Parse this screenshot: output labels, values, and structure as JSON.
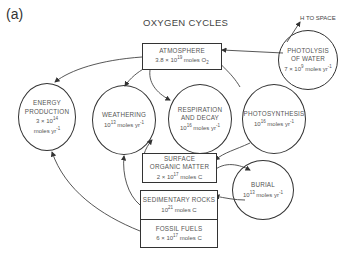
{
  "panel_label": "(a)",
  "title": "OXYGEN CYCLES",
  "note": "H TO SPACE",
  "nodes": {
    "atmosphere": {
      "name": "ATMOSPHERE",
      "value": "3.8 × 10^19 moles O2",
      "shape": "box"
    },
    "photolysis": {
      "name": "PHOTOLYSIS OF WATER",
      "value": "7 × 10^9 moles yr^-1",
      "shape": "circle"
    },
    "energy": {
      "name": "ENERGY PRODUCTION",
      "value": "3 × 10^14 moles yr^-1",
      "shape": "circle"
    },
    "weathering": {
      "name": "WEATHERING",
      "value": "10^13 moles yr^-1",
      "shape": "circle"
    },
    "respiration": {
      "name": "RESPIRATION AND DECAY",
      "value": "10^16 moles yr^-1",
      "shape": "circle"
    },
    "photosynthesis": {
      "name": "PHOTOSYNTHESIS",
      "value": "10^16 moles yr^-1",
      "shape": "circle"
    },
    "surface": {
      "name": "SURFACE ORGANIC MATTER",
      "value": "2 × 10^17 moles C",
      "shape": "box"
    },
    "burial": {
      "name": "BURIAL",
      "value": "10^13 moles yr^-1",
      "shape": "circle"
    },
    "sedimentary": {
      "name": "SEDIMENTARY ROCKS",
      "value": "10^21 moles C",
      "shape": "box"
    },
    "fossil": {
      "name": "FOSSIL FUELS",
      "value": "6 × 10^17 moles C",
      "shape": "box"
    }
  },
  "text": {
    "atm_name": "ATMOSPHERE",
    "atm_val_a": "3.8 × 10",
    "atm_exp": "19",
    "atm_val_b": " moles O",
    "atm_sub": "2",
    "pho_name1": "PHOTOLYSIS",
    "pho_name2": "OF WATER",
    "pho_val_a": "7 × 10",
    "pho_exp": "9",
    "pho_val_b": " moles yr",
    "pho_exp2": "-1",
    "en_name1": "ENERGY",
    "en_name2": "PRODUCTION",
    "en_val_a": "3 × 10",
    "en_exp": "14",
    "en_val_b": "moles yr",
    "en_exp2": "-1",
    "we_name": "WEATHERING",
    "we_val_a": "10",
    "we_exp": "13",
    "we_val_b": " moles yr",
    "we_exp2": "-1",
    "re_name1": "RESPIRATION",
    "re_name2": "AND DECAY",
    "re_val_a": "10",
    "re_exp": "16",
    "re_val_b": " moles yr",
    "re_exp2": "-1",
    "ps_name": "PHOTOSYNTHESIS",
    "ps_val_a": "10",
    "ps_exp": "16",
    "ps_val_b": " moles yr",
    "ps_exp2": "-1",
    "so_name1": "SURFACE",
    "so_name2": "ORGANIC MATTER",
    "so_val_a": "2 × 10",
    "so_exp": "17",
    "so_val_b": " moles C",
    "bu_name": "BURIAL",
    "bu_val_a": "10",
    "bu_exp": "13",
    "bu_val_b": " moles yr",
    "bu_exp2": "-1",
    "sr_name": "SEDIMENTARY ROCKS",
    "sr_val_a": "10",
    "sr_exp": "21",
    "sr_val_b": " moles C",
    "ff_name": "FOSSIL FUELS",
    "ff_val_a": "6 × 10",
    "ff_exp": "17",
    "ff_val_b": " moles C"
  }
}
